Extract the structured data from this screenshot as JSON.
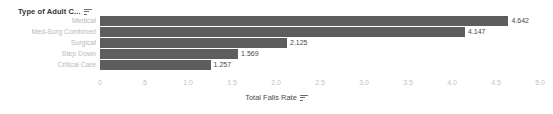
{
  "chart_data": {
    "type": "bar",
    "orientation": "horizontal",
    "title": "",
    "categories": [
      "Medical",
      "Med-Surg Combined",
      "Surgical",
      "Step Down",
      "Critical Care"
    ],
    "values": [
      4.642,
      4.147,
      2.125,
      1.569,
      1.257
    ],
    "value_labels": [
      "4.642",
      "4.147",
      "2.125",
      "1.569",
      "1.257"
    ],
    "xlabel": "Total Falls Rate",
    "ylabel": "Type of Adult C...",
    "xlim": [
      0,
      5
    ],
    "xticks": [
      0,
      0.5,
      1.0,
      1.5,
      2.0,
      2.5,
      3.0,
      3.5,
      4.0,
      4.5,
      5.0
    ],
    "xtick_labels": [
      "0",
      ".5",
      "1.0",
      "1.5",
      "2.0",
      "2.5",
      "3.0",
      "3.5",
      "4.0",
      "4.5",
      "5.0"
    ],
    "grid": false,
    "legend": null,
    "bar_color": "#5d5d5d",
    "category_label_color": "#b9b9b9",
    "tick_label_color": "#c2c2c2",
    "value_label_color": "#4a4a4a",
    "background_color": "#ffffff"
  },
  "pane": {
    "row_header_title": "Type of Adult C...",
    "row_header_sort_icon": "sort-descending-icon"
  },
  "axis": {
    "x_title": "Total Falls Rate",
    "x_title_sort_icon": "sort-descending-icon"
  }
}
